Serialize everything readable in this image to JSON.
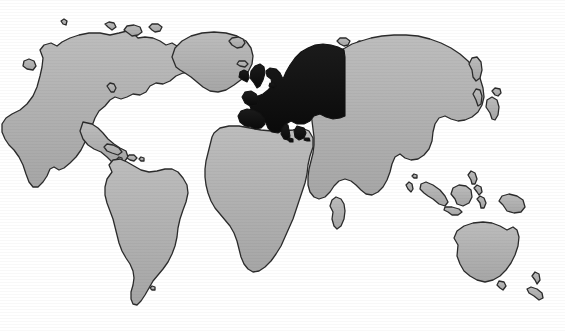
{
  "figure": {
    "kind": "world-map",
    "caption": "",
    "background_color": "#ffffff",
    "has_top_rule": true,
    "top_rule_color": "#6e6e6e",
    "labels_present": false
  },
  "legend": {
    "highlight_label": "Europe",
    "highlight_color": "#121212",
    "other_label": "Rest of world",
    "other_color": "#b2b2b2",
    "outline_color": "#2b2b2b"
  },
  "regions": [
    {
      "id": "north-america",
      "name": "North America",
      "highlighted": false,
      "fill": "#b2b2b2"
    },
    {
      "id": "greenland",
      "name": "Greenland",
      "highlighted": false,
      "fill": "#b2b2b2"
    },
    {
      "id": "iceland",
      "name": "Iceland",
      "highlighted": false,
      "fill": "#b2b2b2"
    },
    {
      "id": "central-america",
      "name": "Central America",
      "highlighted": false,
      "fill": "#b2b2b2"
    },
    {
      "id": "caribbean",
      "name": "Caribbean Islands",
      "highlighted": false,
      "fill": "#b2b2b2"
    },
    {
      "id": "south-america",
      "name": "South America",
      "highlighted": false,
      "fill": "#b2b2b2"
    },
    {
      "id": "europe",
      "name": "Europe",
      "highlighted": true,
      "fill": "#121212"
    },
    {
      "id": "british-isles",
      "name": "British Isles",
      "highlighted": true,
      "fill": "#121212"
    },
    {
      "id": "ireland",
      "name": "Ireland",
      "highlighted": true,
      "fill": "#121212"
    },
    {
      "id": "iberia-italy-balkans",
      "name": "Southern Europe",
      "highlighted": true,
      "fill": "#121212"
    },
    {
      "id": "scandinavia",
      "name": "Scandinavia",
      "highlighted": true,
      "fill": "#121212"
    },
    {
      "id": "africa",
      "name": "Africa",
      "highlighted": false,
      "fill": "#b2b2b2"
    },
    {
      "id": "madagascar",
      "name": "Madagascar",
      "highlighted": false,
      "fill": "#b2b2b2"
    },
    {
      "id": "asia",
      "name": "Asia",
      "highlighted": false,
      "fill": "#b2b2b2"
    },
    {
      "id": "japan",
      "name": "Japan",
      "highlighted": false,
      "fill": "#b2b2b2"
    },
    {
      "id": "indonesia",
      "name": "Indonesia",
      "highlighted": false,
      "fill": "#b2b2b2"
    },
    {
      "id": "philippines",
      "name": "Philippines",
      "highlighted": false,
      "fill": "#b2b2b2"
    },
    {
      "id": "new-guinea",
      "name": "New Guinea",
      "highlighted": false,
      "fill": "#b2b2b2"
    },
    {
      "id": "australia",
      "name": "Australia",
      "highlighted": false,
      "fill": "#b2b2b2"
    },
    {
      "id": "new-zealand",
      "name": "New Zealand",
      "highlighted": false,
      "fill": "#b2b2b2"
    },
    {
      "id": "sri-lanka",
      "name": "Sri Lanka",
      "highlighted": false,
      "fill": "#b2b2b2"
    }
  ],
  "shapes": {
    "north_america": "M128,155 L124,139 L131,131 L140,127 L147,131 L152,124 L160,116 L171,110 L183,105 L196,102 L212,101 L228,102 L241,105 L252,103 L262,99 L271,100 L277,105 L285,104 L296,104 L306,108 L315,112 L323,110 L331,113 L338,120 L345,118 L353,122 L360,127 L368,126 L376,129 L380,136 L375,141 L366,142 L358,146 L352,152 L345,154 L338,152 L331,155 L327,162 L320,166 L312,164 L306,168 L299,169 L293,166 L286,169 L280,176 L272,180 L266,187 L261,195 L256,204 L251,212 L247,221 L241,228 L234,234 L228,236 L223,233 L219,236 L215,243 L209,247 L203,246 L199,241 L196,234 L193,226 L188,219 L182,214 L176,209 L171,203 L166,196 L162,188 L158,180 L153,174 L147,170 L141,166 L134,162 Z",
    "greenland": "M321,86 L317,77 L320,69 L327,63 L336,58 L347,55 L359,54 L371,55 L382,58 L391,62 L398,68 L403,75 L406,83 L405,92 L401,100 L395,107 L388,113 L381,118 L373,121 L365,122 L357,120 L350,116 L344,111 L338,105 L332,99 L326,93 Z",
    "iceland": "M411,87 L408,83 L410,79 L415,77 L421,77 L426,79 L428,83 L426,88 L421,91 L415,91 Z",
    "south_america": "M176,190 L172,183 L175,177 L181,174 L188,175 L194,179 L200,184 L207,188 L214,190 L221,189 L228,186 L235,185 L242,187 L248,191 L253,197 L257,204 L259,212 L258,221 L255,229 L251,237 L248,246 L246,255 L245,264 L243,273 L240,281 L236,288 L231,294 L226,299 L221,305 L217,311 L213,317 L209,322 L205,325 L201,324 L199,319 L199,312 L201,305 L202,298 L201,291 L198,285 L194,279 L190,273 L187,266 L185,258 L183,250 L181,242 L178,234 L175,226 L172,218 L170,210 L170,202 L172,195 Z",
    "africa": "M234,120 L240,116 L249,115 L259,116 L270,118 L281,120 L292,121 L303,121 L313,120 L322,118 L329,121 L332,128 L331,137 L328,145 L326,154 L325,163 L323,172 L320,181 L317,190 L314,199 L311,208 L308,217 L304,226 L300,235 L296,244 L291,252 L286,259 L281,265 L275,269 L269,270 L264,267 L260,262 L257,255 L255,247 L253,239 L250,231 L246,224 L241,218 L236,212 L231,206 L227,199 L224,191 L222,183 L221,175 L221,167 L222,159 L224,151 L226,143 L228,135 L230,127 Z",
    "madagascar": "M327,197 L324,192 L326,187 L330,185 L335,186 L338,190 L339,196 L338,203 L335,209 L331,212 L327,210 L325,205 Z",
    "asia": "M345,102 L352,95 L360,89 L369,84 L379,80 L390,77 L402,75 L414,74 L426,74 L438,76 L450,79 L461,83 L471,88 L480,94 L488,101 L495,109 L500,118 L503,127 L504,136 L502,144 L498,151 L492,156 L485,159 L478,160 L471,158 L465,155 L459,157 L455,163 L453,171 L452,180 L449,188 L444,194 L438,198 L431,199 L425,197 L420,193 L415,196 L412,203 L410,211 L407,219 L403,226 L398,231 L392,234 L386,233 L381,229 L376,224 L371,220 L365,218 L359,220 L354,225 L350,231 L345,236 L339,238 L334,236 L330,231 L328,224 L328,216 L329,208 L331,200 L333,192 L334,184 L334,176 L333,168 L332,160 L331,152 L331,144 L333,136 L336,128 L339,120 L342,112 Z",
    "japan": "M492,129 L489,124 L491,119 L496,117 L501,119 L503,124 L502,130 L499,135 L495,136 Z",
    "australia": "M455,250 L452,243 L456,237 L463,233 L472,231 L481,231 L490,233 L498,236 L506,238 L513,236 L518,239 L520,246 L519,254 L516,262 L512,269 L507,275 L501,280 L494,283 L487,284 L480,282 L474,278 L469,273 L464,269 L459,265 L456,259 Z",
    "new_zealand": "M520,292 L518,287 L521,283 L526,284 L529,289 L528,295 L524,298 L521,296 Z",
    "new_guinea": "M497,215 L494,210 L498,206 L505,205 L512,207 L517,211 L519,217 L516,222 L510,223 L503,221 Z",
    "sri_lanka": "M414,206 L412,202 L415,199 L418,201 L419,206 L417,209 Z"
  }
}
